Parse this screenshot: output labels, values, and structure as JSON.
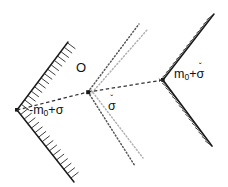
{
  "figure": {
    "background_color": "#ffffff",
    "ink_color": "#1a1a1a",
    "dotted_color": "#555555",
    "dotted_light_color": "#a8a8a8",
    "width": 228,
    "height": 187
  },
  "labels": {
    "origin": "O",
    "left_wedge": {
      "prefix": "-m",
      "subscript": "0",
      "plus": "+",
      "sigma": "σ",
      "caron": "ˇ",
      "full": "-m₀+σ̌"
    },
    "right_wedge": {
      "prefix": "m",
      "subscript": "0",
      "plus": "+",
      "sigma": "σ",
      "caron": "ˇ",
      "full": "m₀+σ̌"
    },
    "center_cone": {
      "sigma": "σ",
      "caron": "ˇ",
      "full": "σ̌"
    }
  },
  "geometry": {
    "origin_point": {
      "x": 88,
      "y": 92
    },
    "left_vertex": {
      "x": 17,
      "y": 110
    },
    "right_vertex": {
      "x": 163,
      "y": 80
    },
    "left_wedge_arms": [
      {
        "x": 68,
        "y": 42
      },
      {
        "x": 74,
        "y": 182
      }
    ],
    "right_wedge_arms": [
      {
        "x": 214,
        "y": 14
      },
      {
        "x": 212,
        "y": 146
      }
    ],
    "center_dotted_rays_upper": [
      {
        "x": 139,
        "y": 24
      },
      {
        "x": 147,
        "y": 30
      }
    ],
    "center_dotted_rays_lower": [
      {
        "x": 135,
        "y": 166
      },
      {
        "x": 143,
        "y": 158
      }
    ],
    "dashed_links": [
      {
        "from": "left_vertex",
        "to": "origin_point"
      },
      {
        "from": "origin_point",
        "to": "right_vertex"
      }
    ]
  }
}
